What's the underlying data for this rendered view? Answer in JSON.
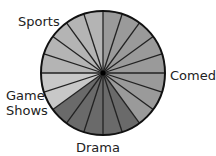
{
  "chart_data": {
    "type": "pie",
    "title": "",
    "slices_total": 20,
    "slice_degrees": 18,
    "start_angle_deg": 0,
    "direction": "clockwise",
    "categories": [
      "Comedy",
      "Drama",
      "Game Shows",
      "Sports"
    ],
    "values": [
      40,
      25,
      10,
      25
    ],
    "slice_counts": [
      8,
      5,
      2,
      5
    ],
    "colors": [
      "#9a9a9a",
      "#6a6a6a",
      "#c8c8c8",
      "#b4b4b4"
    ],
    "labels": {
      "comedy": "Comedy",
      "drama": "Drama",
      "game_shows_line1": "Game",
      "game_shows_line2": "Shows",
      "sports": "Sports"
    },
    "legend": "none",
    "grid": false
  },
  "style": {
    "outline_color": "#111111",
    "divider_color": "#222222"
  }
}
